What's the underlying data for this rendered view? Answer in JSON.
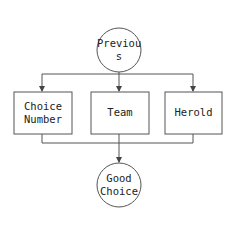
{
  "diagram": {
    "type": "flowchart",
    "nodes": {
      "start": {
        "shape": "circle",
        "line1": "Previou",
        "line2": "s"
      },
      "choice_number": {
        "shape": "rect",
        "line1": "Choice",
        "line2": "Number"
      },
      "team": {
        "shape": "rect",
        "line1": "Team"
      },
      "herold": {
        "shape": "rect",
        "line1": "Herold"
      },
      "end": {
        "shape": "circle",
        "line1": "Good",
        "line2": "Choice"
      }
    },
    "edges": [
      {
        "from": "Previous",
        "to": "Choice Number"
      },
      {
        "from": "Previous",
        "to": "Team"
      },
      {
        "from": "Previous",
        "to": "Herold"
      },
      {
        "from": "Choice Number",
        "to": "Good Choice"
      },
      {
        "from": "Team",
        "to": "Good Choice"
      },
      {
        "from": "Herold",
        "to": "Good Choice"
      }
    ],
    "colors": {
      "stroke": "#555555",
      "text": "#222222",
      "background": "#ffffff"
    }
  }
}
